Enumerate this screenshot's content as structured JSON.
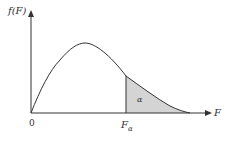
{
  "diagram": {
    "y_axis_label": "f(F)",
    "x_axis_label": "F",
    "origin_label": "0",
    "critical_value_label": "F",
    "critical_value_subscript": "α",
    "shaded_area_label": "α",
    "colors": {
      "curve": "#333333",
      "axes": "#333333",
      "shaded_region": "#d4d4d4",
      "background": "#ffffff"
    }
  }
}
